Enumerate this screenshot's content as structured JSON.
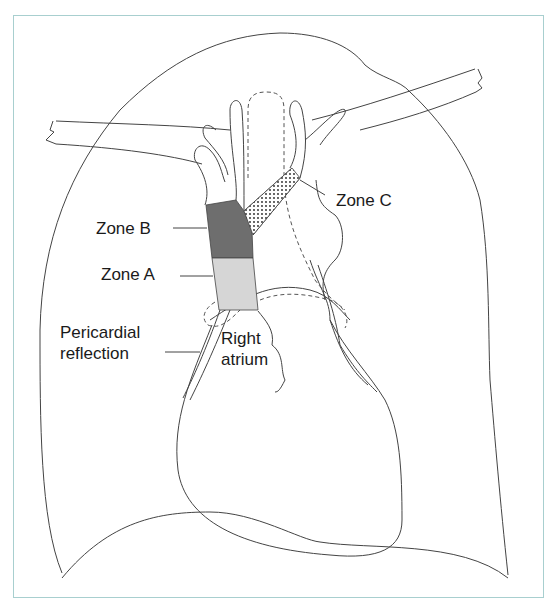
{
  "figure": {
    "labels": {
      "zone_a": "Zone A",
      "zone_b": "Zone B",
      "zone_c": "Zone C",
      "pericardial_line1": "Pericardial",
      "pericardial_line2": "reflection",
      "right_atrium_line1": "Right",
      "right_atrium_line2": "atrium"
    },
    "colors": {
      "frame": "#a8cfcf",
      "zone_b_fill": "#6e6e6e",
      "zone_a_fill": "#d6d6d6",
      "zone_c_pattern": "#222222",
      "stroke": "#333333"
    }
  }
}
